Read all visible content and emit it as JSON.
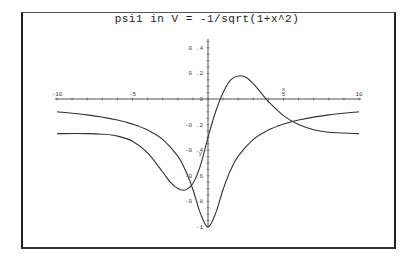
{
  "chart_data": {
    "type": "line",
    "title": "psi1 in V = -1/sqrt(1+x^2)",
    "xlabel": "x",
    "ylabel": "y",
    "xlim": [
      -10,
      10
    ],
    "ylim": [
      -1,
      0.4
    ],
    "x_ticks": [
      -10,
      -5,
      0,
      5,
      10
    ],
    "x_tick_labels": [
      "-10",
      "-5",
      "0",
      "5",
      "10"
    ],
    "y_ticks": [
      0.4,
      0.2,
      0,
      -0.2,
      -0.4,
      -0.6,
      -0.8,
      -1
    ],
    "y_tick_labels": [
      "0.4",
      "0.2",
      "0",
      "-0.2",
      "-0.4",
      "-0.6",
      "-0.8",
      "-1"
    ],
    "grid": false,
    "legend": null,
    "series": [
      {
        "name": "V = -1/sqrt(1+x^2)",
        "x": [
          -10,
          -8,
          -6,
          -5,
          -4,
          -3,
          -2,
          -1.5,
          -1,
          -0.5,
          0,
          0.5,
          1,
          1.5,
          2,
          3,
          4,
          5,
          6,
          8,
          10
        ],
        "y": [
          -0.0995,
          -0.124,
          -0.164,
          -0.196,
          -0.243,
          -0.316,
          -0.447,
          -0.555,
          -0.707,
          -0.894,
          -1.0,
          -0.894,
          -0.707,
          -0.555,
          -0.447,
          -0.316,
          -0.243,
          -0.196,
          -0.164,
          -0.124,
          -0.0995
        ]
      },
      {
        "name": "psi1",
        "x": [
          -10,
          -8,
          -7,
          -6,
          -5,
          -4,
          -3,
          -2.5,
          -2,
          -1.5,
          -1,
          -0.5,
          0,
          0.5,
          1,
          1.5,
          2,
          2.5,
          3,
          3.5,
          4,
          5,
          6,
          7,
          8,
          10
        ],
        "y": [
          -0.27,
          -0.27,
          -0.275,
          -0.29,
          -0.33,
          -0.42,
          -0.57,
          -0.65,
          -0.7,
          -0.71,
          -0.66,
          -0.52,
          -0.3,
          -0.1,
          0.05,
          0.15,
          0.18,
          0.17,
          0.12,
          0.05,
          -0.02,
          -0.13,
          -0.2,
          -0.24,
          -0.26,
          -0.27
        ]
      }
    ]
  },
  "axes": {
    "x_axis_name": "x",
    "y_axis_name": "y"
  }
}
